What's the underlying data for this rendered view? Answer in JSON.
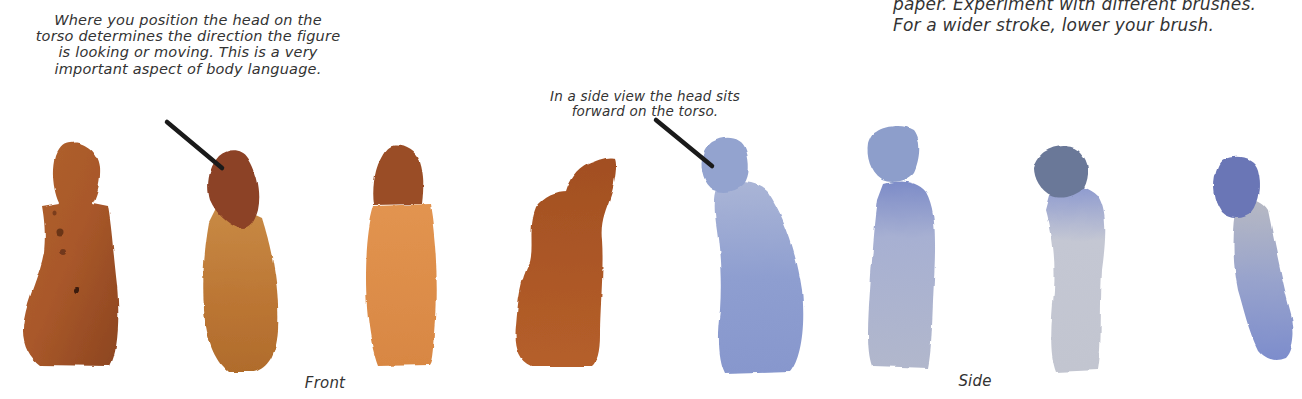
{
  "captions": {
    "front_note": {
      "lines": [
        "Where you position the head on the",
        "torso determines the direction the figure",
        "is looking or moving. This is a very",
        "important aspect of body language."
      ]
    },
    "side_note": {
      "lines": [
        "In a side view the head sits",
        "forward on the torso."
      ]
    },
    "top_right_note": {
      "lines": [
        "paper. Experiment with different brushes.",
        "For a wider stroke, lower your brush."
      ]
    }
  },
  "labels": {
    "front": "Front",
    "side": "Side"
  },
  "figures": {
    "front_group": [
      {
        "name": "front-figure-1",
        "color": "#a8562a"
      },
      {
        "name": "front-figure-2-head-tilted",
        "color": "#c07a35"
      },
      {
        "name": "front-figure-3",
        "color": "#d98a45"
      }
    ],
    "side_group": [
      {
        "name": "side-figure-brown",
        "color": "#a95524"
      },
      {
        "name": "side-figure-blue-1",
        "color": "#8fa0d0"
      },
      {
        "name": "side-figure-blue-2",
        "color": "#a8b2d8"
      },
      {
        "name": "side-figure-gray-blue",
        "color": "#b9bccb"
      },
      {
        "name": "side-figure-blue-4",
        "color": "#8491c4"
      }
    ]
  },
  "colors": {
    "pointer_line": "#1a1a1a",
    "text": "#333333"
  }
}
